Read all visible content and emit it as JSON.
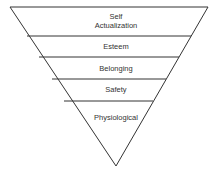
{
  "diagram": {
    "type": "inverted-pyramid",
    "title": "",
    "levels": [
      {
        "label_line1": "Self",
        "label_line2": "Actualization"
      },
      {
        "label": "Esteem"
      },
      {
        "label": "Belonging"
      },
      {
        "label": "Safety"
      },
      {
        "label": "Physiological"
      }
    ],
    "colors": {
      "stroke": "#333333",
      "fill": "#ffffff",
      "text": "#333333"
    }
  }
}
